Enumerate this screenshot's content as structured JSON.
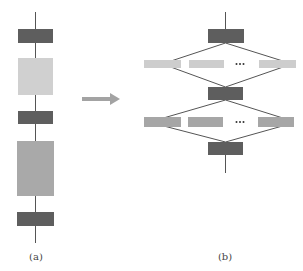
{
  "colors": {
    "dark": "#5e5e5e",
    "light": "#d0d0d0",
    "medium": "#a9a9a9",
    "branch_light": "#cdcdcd",
    "branch_medium": "#a6a6a6",
    "line": "#555555",
    "arrow": "#a3a3a3"
  },
  "panel_a": {
    "label": "(a)",
    "blocks": [
      {
        "name": "dark-block-1",
        "shade": "dark",
        "x": 18,
        "y": 29,
        "w": 35,
        "h": 14
      },
      {
        "name": "light-block",
        "shade": "light",
        "x": 18,
        "y": 58,
        "w": 35,
        "h": 37
      },
      {
        "name": "dark-block-2",
        "shade": "dark",
        "x": 18,
        "y": 111,
        "w": 35,
        "h": 13
      },
      {
        "name": "medium-block",
        "shade": "medium",
        "x": 17,
        "y": 141,
        "w": 37,
        "h": 55
      },
      {
        "name": "dark-block-3",
        "shade": "dark",
        "x": 17,
        "y": 212,
        "w": 37,
        "h": 14
      }
    ]
  },
  "panel_b": {
    "label": "(b)",
    "ellipsis": "…",
    "top_block": {
      "x": 208,
      "y": 29,
      "w": 36,
      "h": 14
    },
    "middle_block": {
      "x": 208,
      "y": 87,
      "w": 35,
      "h": 13
    },
    "bottom_block": {
      "x": 208,
      "y": 142,
      "w": 35,
      "h": 13
    },
    "row1": [
      {
        "x": 144,
        "y": 60,
        "w": 37,
        "h": 8
      },
      {
        "x": 189,
        "y": 60,
        "w": 35,
        "h": 8
      },
      {
        "x": 259,
        "y": 60,
        "w": 37,
        "h": 8
      }
    ],
    "row2": [
      {
        "x": 144,
        "y": 117,
        "w": 37,
        "h": 10
      },
      {
        "x": 188,
        "y": 117,
        "w": 35,
        "h": 10
      },
      {
        "x": 258,
        "y": 117,
        "w": 36,
        "h": 10
      }
    ]
  },
  "arrow": {
    "direction": "right"
  }
}
